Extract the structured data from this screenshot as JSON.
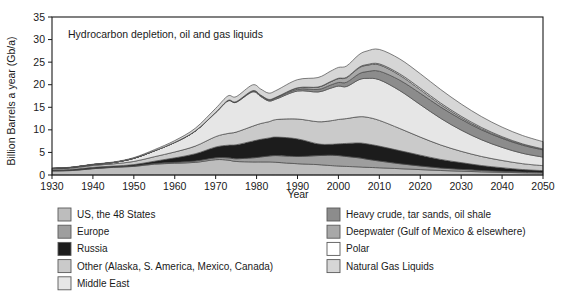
{
  "chart_data": {
    "type": "area",
    "stacked": true,
    "title": "Hydrocarbon depletion, oil and gas liquids",
    "xlabel": "Year",
    "ylabel": "Billion Barrels a year (Gb/a)",
    "xlim": [
      1930,
      2050
    ],
    "ylim": [
      0,
      35
    ],
    "xticks": [
      1930,
      1940,
      1950,
      1960,
      1970,
      1980,
      1990,
      2000,
      2010,
      2020,
      2030,
      2040,
      2050
    ],
    "yticks": [
      0,
      5,
      10,
      15,
      20,
      25,
      30,
      35
    ],
    "grid": false,
    "legend_position": "below",
    "x": [
      1930,
      1935,
      1940,
      1945,
      1950,
      1955,
      1960,
      1965,
      1970,
      1973,
      1975,
      1979,
      1981,
      1983,
      1985,
      1990,
      1995,
      1998,
      2000,
      2002,
      2005,
      2007,
      2010,
      2015,
      2020,
      2025,
      2030,
      2035,
      2040,
      2045,
      2050
    ],
    "series": [
      {
        "name": "US, the 48 States",
        "color": "#bdbdbd",
        "values": [
          0.9,
          1.0,
          1.4,
          1.7,
          1.9,
          2.4,
          2.6,
          2.8,
          3.4,
          3.3,
          3.0,
          2.9,
          2.9,
          2.9,
          2.8,
          2.5,
          2.3,
          2.1,
          2.0,
          1.9,
          1.8,
          1.7,
          1.6,
          1.4,
          1.2,
          1.0,
          0.85,
          0.7,
          0.6,
          0.5,
          0.45
        ]
      },
      {
        "name": "Europe",
        "color": "#9e9e9e",
        "values": [
          0.05,
          0.05,
          0.06,
          0.07,
          0.1,
          0.15,
          0.2,
          0.3,
          0.4,
          0.5,
          0.6,
          0.9,
          1.1,
          1.3,
          1.5,
          1.6,
          2.0,
          2.3,
          2.3,
          2.2,
          2.0,
          1.8,
          1.5,
          1.1,
          0.8,
          0.55,
          0.4,
          0.3,
          0.22,
          0.16,
          0.12
        ]
      },
      {
        "name": "Russia",
        "color": "#1c1c1c",
        "values": [
          0.15,
          0.2,
          0.25,
          0.2,
          0.3,
          0.5,
          1.0,
          1.6,
          2.4,
          2.8,
          3.1,
          3.7,
          3.9,
          4.0,
          4.1,
          3.9,
          2.6,
          2.4,
          2.6,
          2.9,
          3.3,
          3.4,
          3.3,
          2.9,
          2.4,
          1.9,
          1.5,
          1.1,
          0.8,
          0.55,
          0.4
        ]
      },
      {
        "name": "Other (Alaska, S. America, Mexico, Canada)",
        "color": "#cacaca",
        "values": [
          0.25,
          0.3,
          0.4,
          0.5,
          0.7,
          1.0,
          1.3,
          1.7,
          2.3,
          2.6,
          2.8,
          3.3,
          3.5,
          3.6,
          3.9,
          4.4,
          4.9,
          5.2,
          5.4,
          5.5,
          5.8,
          5.9,
          5.7,
          4.9,
          4.0,
          3.2,
          2.5,
          2.0,
          1.6,
          1.3,
          1.1
        ]
      },
      {
        "name": "Middle East",
        "color": "#e6e6e6",
        "values": [
          0.1,
          0.15,
          0.2,
          0.3,
          0.7,
          1.3,
          2.1,
          3.3,
          5.3,
          7.2,
          6.6,
          7.6,
          6.0,
          4.6,
          4.6,
          6.2,
          6.6,
          7.2,
          7.4,
          7.1,
          8.2,
          8.6,
          9.0,
          8.4,
          7.2,
          5.9,
          4.7,
          3.7,
          2.9,
          2.3,
          1.9
        ]
      },
      {
        "name": "Heavy crude, tar sands, oil shale",
        "color": "#8c8c8c",
        "values": [
          0.0,
          0.0,
          0.0,
          0.0,
          0.0,
          0.0,
          0.02,
          0.04,
          0.07,
          0.1,
          0.12,
          0.18,
          0.2,
          0.22,
          0.28,
          0.4,
          0.55,
          0.7,
          0.8,
          0.95,
          1.3,
          1.5,
          1.9,
          2.3,
          2.5,
          2.5,
          2.4,
          2.2,
          2.0,
          1.8,
          1.6
        ]
      },
      {
        "name": "Deepwater (Gulf of Mexico & elsewhere)",
        "color": "#a8a8a8",
        "values": [
          0.0,
          0.0,
          0.0,
          0.0,
          0.0,
          0.0,
          0.0,
          0.0,
          0.0,
          0.02,
          0.03,
          0.08,
          0.1,
          0.12,
          0.15,
          0.3,
          0.5,
          0.7,
          0.85,
          1.0,
          1.3,
          1.4,
          1.4,
          1.1,
          0.8,
          0.55,
          0.38,
          0.26,
          0.18,
          0.13,
          0.09
        ]
      },
      {
        "name": "Polar",
        "color": "#ffffff",
        "values": [
          0.0,
          0.0,
          0.0,
          0.0,
          0.0,
          0.0,
          0.0,
          0.0,
          0.0,
          0.0,
          0.0,
          0.0,
          0.0,
          0.0,
          0.0,
          0.02,
          0.04,
          0.06,
          0.08,
          0.1,
          0.14,
          0.17,
          0.22,
          0.3,
          0.34,
          0.33,
          0.3,
          0.26,
          0.2,
          0.16,
          0.12
        ]
      },
      {
        "name": "Natural Gas Liquids",
        "color": "#d6d6d6",
        "values": [
          0.05,
          0.06,
          0.08,
          0.1,
          0.15,
          0.25,
          0.4,
          0.6,
          0.9,
          1.0,
          1.1,
          1.3,
          1.35,
          1.4,
          1.5,
          1.8,
          2.1,
          2.3,
          2.4,
          2.5,
          2.8,
          3.0,
          3.2,
          3.3,
          3.2,
          3.0,
          2.7,
          2.4,
          2.1,
          1.85,
          1.6
        ]
      }
    ]
  },
  "legend": {
    "left_column": [
      {
        "label": "US, the 48 States",
        "color": "#bdbdbd"
      },
      {
        "label": "Europe",
        "color": "#9e9e9e"
      },
      {
        "label": "Russia",
        "color": "#1c1c1c"
      },
      {
        "label": "Other (Alaska, S. America, Mexico, Canada)",
        "color": "#cacaca"
      },
      {
        "label": "Middle East",
        "color": "#e6e6e6"
      }
    ],
    "right_column": [
      {
        "label": "Heavy crude, tar sands, oil shale",
        "color": "#8c8c8c"
      },
      {
        "label": "Deepwater (Gulf of Mexico & elsewhere)",
        "color": "#a8a8a8"
      },
      {
        "label": "Polar",
        "color": "#ffffff"
      },
      {
        "label": "Natural Gas Liquids",
        "color": "#d6d6d6"
      }
    ]
  }
}
